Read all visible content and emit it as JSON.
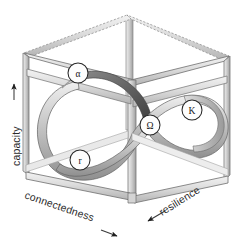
{
  "figure": {
    "background_color": "#ffffff"
  },
  "axes": [
    {
      "id": "capacity",
      "label": "capacity",
      "orientation": "vertical-left",
      "arrow_direction": "up"
    },
    {
      "id": "connectedness",
      "label": "connectedness",
      "orientation": "diagonal-bottom-left",
      "arrow_direction": "down-right"
    },
    {
      "id": "resilience",
      "label": "resilience",
      "orientation": "diagonal-bottom-right",
      "arrow_direction": "down-left"
    }
  ],
  "nodes": [
    {
      "id": "alpha",
      "label": "α",
      "cx": 78,
      "cy": 73,
      "r": 10
    },
    {
      "id": "r",
      "label": "r",
      "cx": 80,
      "cy": 160,
      "r": 10
    },
    {
      "id": "omega",
      "label": "Ω",
      "cx": 150,
      "cy": 125,
      "r": 10
    },
    {
      "id": "kappa",
      "label": "K",
      "cx": 192,
      "cy": 110,
      "r": 10
    }
  ],
  "colors": {
    "frame_light": "#e8e8e8",
    "frame_mid": "#cfcfcf",
    "frame_dark": "#a8a8a8",
    "frame_outline": "#7d7d7d",
    "ribbon_light": "#e2e2e2",
    "ribbon_mid": "#bdbdbd",
    "ribbon_dark": "#6e6e6e",
    "ribbon_outline": "#5a5a5a",
    "text": "#2b2b2b"
  }
}
